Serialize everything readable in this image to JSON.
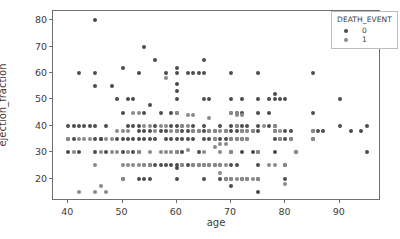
{
  "chart_data": {
    "type": "scatter",
    "title": "",
    "xlabel": "age",
    "ylabel": "ejection_fraction",
    "xlim": [
      37.2,
      97.6
    ],
    "ylim": [
      11.5,
      83.5
    ],
    "xticks": [
      40,
      50,
      60,
      70,
      80,
      90
    ],
    "yticks": [
      20,
      30,
      40,
      50,
      60,
      70,
      80
    ],
    "grid": false,
    "legend": {
      "title": "DEATH_EVENT",
      "position": "upper right",
      "entries": [
        {
          "label": "0",
          "color": "#4c4c4c"
        },
        {
          "label": "1",
          "color": "#8a8a8a"
        }
      ]
    },
    "marker_size": 4,
    "series": [
      {
        "name": "0",
        "color": "#4c4c4c",
        "points": [
          [
            40,
            40
          ],
          [
            40,
            35
          ],
          [
            40,
            30
          ],
          [
            41,
            40
          ],
          [
            41,
            35
          ],
          [
            42,
            40
          ],
          [
            42,
            60
          ],
          [
            42,
            30
          ],
          [
            43,
            40
          ],
          [
            44,
            40
          ],
          [
            45,
            40
          ],
          [
            45,
            35
          ],
          [
            45,
            30
          ],
          [
            45,
            80
          ],
          [
            45,
            60
          ],
          [
            45,
            55
          ],
          [
            46,
            35
          ],
          [
            46,
            35
          ],
          [
            47,
            40
          ],
          [
            47,
            30
          ],
          [
            48,
            55
          ],
          [
            49,
            35
          ],
          [
            49,
            50
          ],
          [
            50,
            62
          ],
          [
            50,
            45
          ],
          [
            50,
            35
          ],
          [
            50,
            30
          ],
          [
            50,
            20
          ],
          [
            51,
            50
          ],
          [
            51,
            40
          ],
          [
            51,
            35
          ],
          [
            52,
            50
          ],
          [
            52,
            40
          ],
          [
            52,
            35
          ],
          [
            52,
            30
          ],
          [
            53,
            60
          ],
          [
            53,
            40
          ],
          [
            53,
            38
          ],
          [
            53,
            35
          ],
          [
            53,
            30
          ],
          [
            53,
            20
          ],
          [
            54,
            70
          ],
          [
            54,
            45
          ],
          [
            54,
            38
          ],
          [
            54,
            35
          ],
          [
            54,
            20
          ],
          [
            55,
            48
          ],
          [
            55,
            38
          ],
          [
            55,
            35
          ],
          [
            55,
            25
          ],
          [
            55,
            20
          ],
          [
            56,
            65
          ],
          [
            56,
            40
          ],
          [
            56,
            35
          ],
          [
            56,
            25
          ],
          [
            57,
            45
          ],
          [
            57,
            38
          ],
          [
            57,
            25
          ],
          [
            58,
            60
          ],
          [
            58,
            38
          ],
          [
            58,
            35
          ],
          [
            58,
            25
          ],
          [
            59,
            45
          ],
          [
            59,
            40
          ],
          [
            59,
            35
          ],
          [
            59,
            25
          ],
          [
            60,
            62
          ],
          [
            60,
            60
          ],
          [
            60,
            56
          ],
          [
            60,
            53
          ],
          [
            60,
            50
          ],
          [
            60,
            45
          ],
          [
            60,
            40
          ],
          [
            60,
            38
          ],
          [
            60,
            35
          ],
          [
            60,
            30
          ],
          [
            60,
            25
          ],
          [
            60,
            24
          ],
          [
            60,
            20
          ],
          [
            61,
            40
          ],
          [
            61,
            38
          ],
          [
            61,
            35
          ],
          [
            61,
            30
          ],
          [
            61,
            25
          ],
          [
            62,
            60
          ],
          [
            62,
            38
          ],
          [
            62,
            35
          ],
          [
            62,
            25
          ],
          [
            63,
            60
          ],
          [
            63,
            40
          ],
          [
            63,
            38
          ],
          [
            63,
            35
          ],
          [
            63,
            25
          ],
          [
            64,
            60
          ],
          [
            64,
            38
          ],
          [
            64,
            30
          ],
          [
            64,
            25
          ],
          [
            65,
            65
          ],
          [
            65,
            60
          ],
          [
            65,
            50
          ],
          [
            65,
            40
          ],
          [
            65,
            38
          ],
          [
            65,
            35
          ],
          [
            65,
            25
          ],
          [
            65,
            20
          ],
          [
            66,
            50
          ],
          [
            66,
            38
          ],
          [
            66,
            35
          ],
          [
            66,
            25
          ],
          [
            67,
            38
          ],
          [
            67,
            35
          ],
          [
            67,
            25
          ],
          [
            68,
            40
          ],
          [
            68,
            35
          ],
          [
            68,
            25
          ],
          [
            68,
            20
          ],
          [
            69,
            38
          ],
          [
            69,
            35
          ],
          [
            69,
            20
          ],
          [
            70,
            60
          ],
          [
            70,
            50
          ],
          [
            70,
            45
          ],
          [
            70,
            40
          ],
          [
            70,
            38
          ],
          [
            70,
            35
          ],
          [
            70,
            30
          ],
          [
            70,
            25
          ],
          [
            70,
            20
          ],
          [
            70,
            17
          ],
          [
            71,
            45
          ],
          [
            71,
            40
          ],
          [
            71,
            38
          ],
          [
            71,
            35
          ],
          [
            71,
            25
          ],
          [
            72,
            50
          ],
          [
            72,
            45
          ],
          [
            72,
            40
          ],
          [
            72,
            38
          ],
          [
            72,
            35
          ],
          [
            72,
            30
          ],
          [
            72,
            20
          ],
          [
            73,
            40
          ],
          [
            73,
            35
          ],
          [
            73,
            20
          ],
          [
            74,
            38
          ],
          [
            74,
            30
          ],
          [
            75,
            60
          ],
          [
            75,
            50
          ],
          [
            75,
            45
          ],
          [
            75,
            40
          ],
          [
            75,
            38
          ],
          [
            75,
            30
          ],
          [
            75,
            25
          ],
          [
            75,
            20
          ],
          [
            75,
            15
          ],
          [
            77,
            50
          ],
          [
            77,
            45
          ],
          [
            77,
            40
          ],
          [
            78,
            52
          ],
          [
            78,
            50
          ],
          [
            78,
            40
          ],
          [
            78,
            38
          ],
          [
            78,
            35
          ],
          [
            78,
            30
          ],
          [
            79,
            50
          ],
          [
            79,
            35
          ],
          [
            80,
            50
          ],
          [
            80,
            38
          ],
          [
            80,
            35
          ],
          [
            80,
            25
          ],
          [
            80,
            20
          ],
          [
            81,
            38
          ],
          [
            81,
            35
          ],
          [
            82,
            30
          ],
          [
            85,
            60
          ],
          [
            85,
            45
          ],
          [
            85,
            38
          ],
          [
            85,
            35
          ],
          [
            86,
            38
          ],
          [
            87,
            38
          ],
          [
            90,
            50
          ],
          [
            90,
            40
          ],
          [
            92,
            38
          ],
          [
            94,
            38
          ],
          [
            95,
            40
          ],
          [
            95,
            30
          ]
        ]
      },
      {
        "name": "1",
        "color": "#8a8a8a",
        "points": [
          [
            42,
            15
          ],
          [
            45,
            15
          ],
          [
            45,
            25
          ],
          [
            46,
            17
          ],
          [
            47,
            15
          ],
          [
            48,
            30
          ],
          [
            49,
            30
          ],
          [
            50,
            25
          ],
          [
            50,
            20
          ],
          [
            51,
            25
          ],
          [
            51,
            30
          ],
          [
            52,
            25
          ],
          [
            53,
            25
          ],
          [
            53,
            30
          ],
          [
            54,
            25
          ],
          [
            54,
            25
          ],
          [
            55,
            25
          ],
          [
            55,
            30
          ],
          [
            57,
            30
          ],
          [
            58,
            30
          ],
          [
            59,
            30
          ],
          [
            60,
            30
          ],
          [
            60,
            30
          ],
          [
            61,
            25
          ],
          [
            62,
            31
          ],
          [
            63,
            25
          ],
          [
            64,
            25
          ],
          [
            65,
            25
          ],
          [
            65,
            30
          ],
          [
            66,
            25
          ],
          [
            67,
            25
          ],
          [
            67,
            32
          ],
          [
            68,
            22
          ],
          [
            68,
            25
          ],
          [
            68,
            30
          ],
          [
            69,
            20
          ],
          [
            69,
            25
          ],
          [
            70,
            20
          ],
          [
            70,
            30
          ],
          [
            71,
            20
          ],
          [
            71,
            40
          ],
          [
            71,
            44
          ],
          [
            72,
            20
          ],
          [
            72,
            35
          ],
          [
            73,
            20
          ],
          [
            73,
            38
          ],
          [
            74,
            20
          ],
          [
            75,
            20
          ],
          [
            75,
            30
          ],
          [
            77,
            25
          ],
          [
            78,
            25
          ],
          [
            79,
            35
          ],
          [
            80,
            18
          ],
          [
            80,
            25
          ],
          [
            81,
            35
          ],
          [
            82,
            30
          ],
          [
            58,
            58
          ],
          [
            60,
            45
          ],
          [
            62,
            44
          ],
          [
            63,
            44
          ],
          [
            66,
            43
          ],
          [
            67,
            35
          ],
          [
            68,
            33
          ],
          [
            69,
            33
          ],
          [
            70,
            45
          ],
          [
            70,
            30
          ],
          [
            71,
            45
          ],
          [
            72,
            44
          ],
          [
            73,
            35
          ],
          [
            74,
            38
          ],
          [
            76,
            40
          ],
          [
            78,
            40
          ],
          [
            78,
            38
          ],
          [
            79,
            38
          ],
          [
            85,
            35
          ],
          [
            85,
            38
          ],
          [
            72,
            38
          ],
          [
            73,
            38
          ],
          [
            71,
            35
          ],
          [
            70,
            35
          ],
          [
            69,
            38
          ],
          [
            68,
            38
          ],
          [
            67,
            38
          ],
          [
            66,
            38
          ],
          [
            64,
            38
          ],
          [
            63,
            38
          ],
          [
            62,
            40
          ],
          [
            61,
            40
          ],
          [
            60,
            38
          ],
          [
            59,
            38
          ],
          [
            58,
            40
          ],
          [
            57,
            40
          ],
          [
            56,
            38
          ],
          [
            55,
            40
          ],
          [
            54,
            40
          ],
          [
            53,
            45
          ],
          [
            52,
            45
          ],
          [
            51,
            38
          ],
          [
            50,
            38
          ],
          [
            49,
            38
          ],
          [
            48,
            35
          ],
          [
            47,
            35
          ],
          [
            46,
            30
          ],
          [
            44,
            35
          ],
          [
            43,
            35
          ],
          [
            42,
            35
          ],
          [
            41,
            30
          ],
          [
            40,
            35
          ]
        ]
      }
    ]
  }
}
